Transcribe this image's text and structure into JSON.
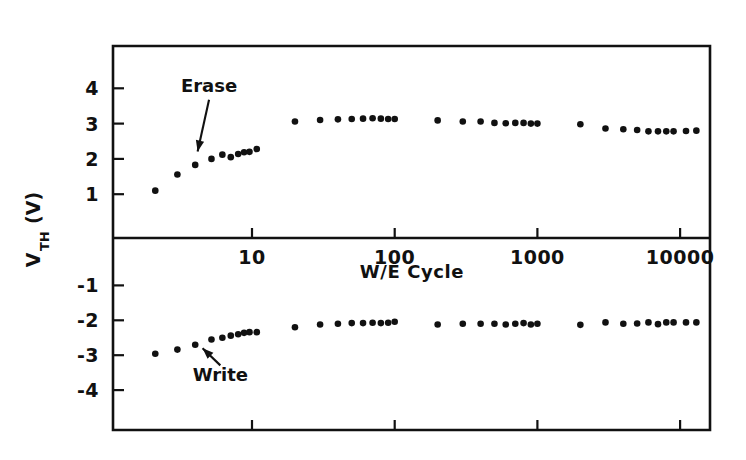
{
  "chart_data": {
    "type": "scatter",
    "title": "",
    "xlabel": "W/E Cycle",
    "ylabel": "V_TH (V)",
    "ylabel_main": "V",
    "ylabel_sub": "TH",
    "ylabel_unit": " (V)",
    "xscale": "log",
    "xlim": [
      2,
      20000
    ],
    "ylim": [
      -4.9,
      4.9
    ],
    "grid": false,
    "legend": "none",
    "xticks": [
      10,
      100,
      1000,
      10000
    ],
    "xticklabels": [
      "10",
      "100",
      "1000",
      "10000"
    ],
    "yticks": [
      4,
      3,
      2,
      1,
      -1,
      -2,
      -3,
      -4
    ],
    "yticklabels": [
      "4",
      "3",
      "2",
      "1",
      "-1",
      "-2",
      "-3",
      "-4"
    ],
    "divider_y": 0,
    "annotations": [
      {
        "label": "Erase",
        "text_x": 5.0,
        "text_y": 3.9,
        "point_x": 4.1,
        "point_y": 2.1
      },
      {
        "label": "Write",
        "text_x": 6.0,
        "text_y": -3.75,
        "point_x": 4.3,
        "point_y": -2.72
      }
    ],
    "series": [
      {
        "name": "Erase",
        "marker": "dot",
        "color": "#111111",
        "points": [
          [
            2.1,
            1.1
          ],
          [
            3.0,
            1.56
          ],
          [
            4.0,
            1.83
          ],
          [
            5.2,
            2.0
          ],
          [
            6.2,
            2.12
          ],
          [
            7.1,
            2.05
          ],
          [
            8.0,
            2.14
          ],
          [
            8.8,
            2.19
          ],
          [
            9.6,
            2.2
          ],
          [
            10.8,
            2.28
          ],
          [
            20,
            3.06
          ],
          [
            30,
            3.1
          ],
          [
            40,
            3.12
          ],
          [
            50,
            3.13
          ],
          [
            60,
            3.14
          ],
          [
            70,
            3.15
          ],
          [
            80,
            3.14
          ],
          [
            90,
            3.13
          ],
          [
            100,
            3.13
          ],
          [
            200,
            3.09
          ],
          [
            300,
            3.06
          ],
          [
            400,
            3.06
          ],
          [
            500,
            3.02
          ],
          [
            600,
            3.01
          ],
          [
            700,
            3.02
          ],
          [
            800,
            3.02
          ],
          [
            900,
            3.0
          ],
          [
            1000,
            3.0
          ],
          [
            2000,
            2.98
          ],
          [
            3000,
            2.86
          ],
          [
            4000,
            2.84
          ],
          [
            5000,
            2.82
          ],
          [
            6000,
            2.78
          ],
          [
            7000,
            2.78
          ],
          [
            8000,
            2.78
          ],
          [
            9000,
            2.78
          ],
          [
            11000,
            2.79
          ],
          [
            13000,
            2.8
          ]
        ]
      },
      {
        "name": "Write",
        "marker": "dot",
        "color": "#111111",
        "points": [
          [
            2.1,
            -2.96
          ],
          [
            3.0,
            -2.84
          ],
          [
            4.0,
            -2.7
          ],
          [
            5.2,
            -2.55
          ],
          [
            6.2,
            -2.5
          ],
          [
            7.1,
            -2.44
          ],
          [
            8.0,
            -2.4
          ],
          [
            8.8,
            -2.36
          ],
          [
            9.6,
            -2.34
          ],
          [
            10.8,
            -2.34
          ],
          [
            20,
            -2.2
          ],
          [
            30,
            -2.12
          ],
          [
            40,
            -2.1
          ],
          [
            50,
            -2.08
          ],
          [
            60,
            -2.08
          ],
          [
            70,
            -2.07
          ],
          [
            80,
            -2.08
          ],
          [
            90,
            -2.07
          ],
          [
            100,
            -2.04
          ],
          [
            200,
            -2.12
          ],
          [
            300,
            -2.1
          ],
          [
            400,
            -2.1
          ],
          [
            500,
            -2.1
          ],
          [
            600,
            -2.12
          ],
          [
            700,
            -2.1
          ],
          [
            800,
            -2.08
          ],
          [
            900,
            -2.12
          ],
          [
            1000,
            -2.1
          ],
          [
            2000,
            -2.13
          ],
          [
            3000,
            -2.06
          ],
          [
            4000,
            -2.1
          ],
          [
            5000,
            -2.09
          ],
          [
            6000,
            -2.06
          ],
          [
            7000,
            -2.11
          ],
          [
            8000,
            -2.06
          ],
          [
            9000,
            -2.06
          ],
          [
            11000,
            -2.06
          ],
          [
            13000,
            -2.06
          ]
        ]
      }
    ]
  }
}
